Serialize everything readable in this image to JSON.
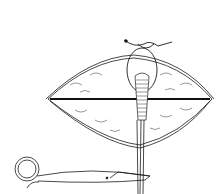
{
  "image": {
    "description": "Line drawing of a surgical wound with a suture loop and scissors",
    "width": 224,
    "height": 194,
    "colors": {
      "background": "#ffffff",
      "ink": "#1a1a1a"
    }
  }
}
